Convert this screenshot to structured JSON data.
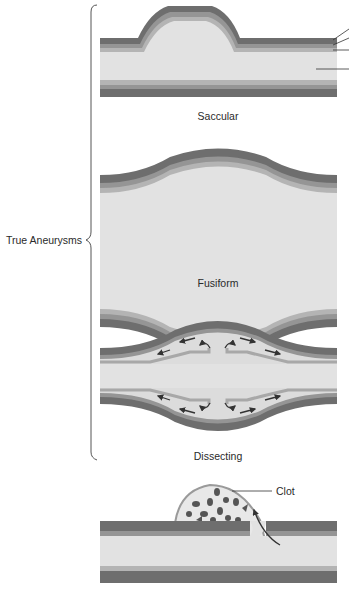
{
  "figure": {
    "group_label": "True Aneurysms",
    "panels": [
      {
        "id": "saccular",
        "caption": "Saccular"
      },
      {
        "id": "fusiform",
        "caption": "Fusiform"
      },
      {
        "id": "dissecting",
        "caption": "Dissecting"
      },
      {
        "id": "false",
        "caption": "",
        "callout": "Clot"
      }
    ],
    "colors": {
      "outer_layer": "#6e6e6e",
      "middle_layer": "#959595",
      "inner_layer": "#b4b4b4",
      "lumen": "#e2e2e2",
      "clot": "#555555",
      "arrow": "#333333",
      "leader_line": "#333333"
    }
  }
}
